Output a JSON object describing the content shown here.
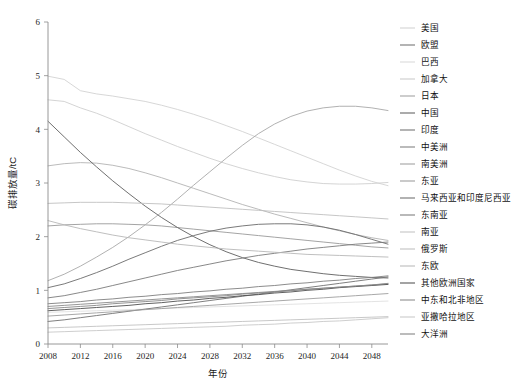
{
  "chart_data": {
    "type": "line",
    "title": "",
    "xlabel": "年份",
    "ylabel": "碳排放量/tC",
    "xlim": [
      2008,
      2050
    ],
    "ylim": [
      0,
      6
    ],
    "grid": false,
    "legend_position": "right",
    "xticks": [
      2008,
      2012,
      2016,
      2020,
      2024,
      2028,
      2032,
      2036,
      2040,
      2044,
      2048
    ],
    "xtick_labels": [
      "2008",
      "2012",
      "2016",
      "2020",
      "2024",
      "2028",
      "2032",
      "2036",
      "2040",
      "2044",
      "2048"
    ],
    "yticks": [
      0,
      1,
      2,
      3,
      4,
      5,
      6
    ],
    "ytick_labels": [
      "0",
      "1",
      "2",
      "3",
      "4",
      "5",
      "6"
    ],
    "x": [
      2008,
      2010,
      2012,
      2014,
      2016,
      2018,
      2020,
      2022,
      2024,
      2026,
      2028,
      2030,
      2032,
      2034,
      2036,
      2038,
      2040,
      2042,
      2044,
      2046,
      2048,
      2050
    ],
    "series": [
      {
        "name": "美国",
        "color": "#d2d2d2",
        "values": [
          4.99,
          4.93,
          4.72,
          4.66,
          4.62,
          4.57,
          4.52,
          4.45,
          4.37,
          4.28,
          4.18,
          4.07,
          3.96,
          3.84,
          3.72,
          3.6,
          3.48,
          3.36,
          3.24,
          3.13,
          3.03,
          2.95
        ]
      },
      {
        "name": "欧盟",
        "color": "#9a9a9a",
        "values": [
          2.2,
          2.22,
          2.23,
          2.24,
          2.24,
          2.23,
          2.22,
          2.2,
          2.17,
          2.14,
          2.11,
          2.08,
          2.05,
          2.02,
          1.99,
          1.96,
          1.93,
          1.9,
          1.87,
          1.84,
          1.81,
          1.79
        ]
      },
      {
        "name": "巴西",
        "color": "#e0e0e0",
        "values": [
          0.59,
          0.6,
          0.61,
          0.62,
          0.63,
          0.64,
          0.65,
          0.66,
          0.67,
          0.68,
          0.69,
          0.7,
          0.71,
          0.72,
          0.73,
          0.74,
          0.75,
          0.76,
          0.77,
          0.78,
          0.79,
          0.8
        ]
      },
      {
        "name": "加拿大",
        "color": "#cfcfcf",
        "values": [
          4.55,
          4.52,
          4.4,
          4.3,
          4.18,
          4.05,
          3.92,
          3.8,
          3.68,
          3.57,
          3.46,
          3.36,
          3.27,
          3.19,
          3.12,
          3.06,
          3.02,
          2.99,
          2.98,
          2.98,
          2.99,
          3.01
        ]
      },
      {
        "name": "日本",
        "color": "#b3b3b3",
        "values": [
          3.32,
          3.36,
          3.38,
          3.37,
          3.33,
          3.27,
          3.19,
          3.1,
          3.0,
          2.9,
          2.8,
          2.7,
          2.6,
          2.51,
          2.42,
          2.34,
          2.26,
          2.18,
          2.11,
          2.04,
          1.98,
          1.93
        ]
      },
      {
        "name": "中国",
        "color": "#5f5f5f",
        "values": [
          4.15,
          3.86,
          3.57,
          3.3,
          3.04,
          2.8,
          2.57,
          2.36,
          2.17,
          2.0,
          1.85,
          1.72,
          1.61,
          1.52,
          1.45,
          1.39,
          1.35,
          1.31,
          1.28,
          1.26,
          1.24,
          1.23
        ]
      },
      {
        "name": "印度",
        "color": "#707070",
        "values": [
          0.42,
          0.45,
          0.49,
          0.53,
          0.57,
          0.61,
          0.65,
          0.69,
          0.73,
          0.77,
          0.81,
          0.85,
          0.89,
          0.93,
          0.97,
          1.01,
          1.05,
          1.09,
          1.13,
          1.17,
          1.21,
          1.25
        ]
      },
      {
        "name": "中美洲",
        "color": "#8a8a8a",
        "values": [
          0.7,
          0.72,
          0.74,
          0.76,
          0.78,
          0.8,
          0.82,
          0.84,
          0.86,
          0.88,
          0.9,
          0.92,
          0.94,
          0.96,
          0.98,
          1.0,
          1.02,
          1.04,
          1.06,
          1.08,
          1.1,
          1.12
        ]
      },
      {
        "name": "南美洲",
        "color": "#9e9e9e",
        "values": [
          0.52,
          0.54,
          0.56,
          0.58,
          0.6,
          0.62,
          0.64,
          0.66,
          0.68,
          0.7,
          0.72,
          0.74,
          0.76,
          0.78,
          0.8,
          0.82,
          0.84,
          0.86,
          0.88,
          0.9,
          0.92,
          0.94
        ]
      },
      {
        "name": "东亚",
        "color": "#a8a8a8",
        "values": [
          1.18,
          1.3,
          1.45,
          1.62,
          1.8,
          2.0,
          2.22,
          2.45,
          2.7,
          2.96,
          3.21,
          3.46,
          3.7,
          3.92,
          4.1,
          4.24,
          4.34,
          4.4,
          4.43,
          4.43,
          4.4,
          4.35
        ]
      },
      {
        "name": "马来西亚和印度尼西亚",
        "color": "#6b6b6b",
        "values": [
          1.05,
          1.12,
          1.22,
          1.33,
          1.45,
          1.58,
          1.7,
          1.82,
          1.93,
          2.02,
          2.1,
          2.16,
          2.2,
          2.23,
          2.24,
          2.24,
          2.22,
          2.18,
          2.12,
          2.04,
          1.95,
          1.86
        ]
      },
      {
        "name": "东南亚",
        "color": "#7a7a7a",
        "values": [
          0.86,
          0.9,
          0.96,
          1.02,
          1.09,
          1.16,
          1.23,
          1.3,
          1.37,
          1.43,
          1.49,
          1.55,
          1.6,
          1.65,
          1.69,
          1.73,
          1.77,
          1.8,
          1.83,
          1.86,
          1.88,
          1.9
        ]
      },
      {
        "name": "南亚",
        "color": "#c2c2c2",
        "values": [
          0.3,
          0.31,
          0.32,
          0.33,
          0.34,
          0.35,
          0.36,
          0.37,
          0.38,
          0.39,
          0.4,
          0.41,
          0.42,
          0.43,
          0.44,
          0.45,
          0.46,
          0.47,
          0.48,
          0.49,
          0.5,
          0.51
        ]
      },
      {
        "name": "俄罗斯",
        "color": "#bfbfbf",
        "values": [
          2.62,
          2.63,
          2.64,
          2.64,
          2.64,
          2.63,
          2.62,
          2.61,
          2.59,
          2.57,
          2.55,
          2.53,
          2.51,
          2.49,
          2.47,
          2.45,
          2.43,
          2.41,
          2.39,
          2.37,
          2.35,
          2.33
        ]
      },
      {
        "name": "东欧",
        "color": "#b8b8b8",
        "values": [
          2.3,
          2.22,
          2.15,
          2.09,
          2.03,
          1.98,
          1.94,
          1.9,
          1.86,
          1.83,
          1.8,
          1.77,
          1.75,
          1.73,
          1.71,
          1.69,
          1.67,
          1.66,
          1.65,
          1.64,
          1.63,
          1.62
        ]
      },
      {
        "name": "其他欧洲国家",
        "color": "#4f4f4f",
        "values": [
          0.62,
          0.64,
          0.66,
          0.68,
          0.7,
          0.72,
          0.75,
          0.77,
          0.8,
          0.82,
          0.85,
          0.87,
          0.9,
          0.92,
          0.95,
          0.97,
          1.0,
          1.02,
          1.05,
          1.07,
          1.09,
          1.11
        ]
      },
      {
        "name": "中东和北非地区",
        "color": "#888888",
        "values": [
          0.66,
          0.68,
          0.7,
          0.72,
          0.75,
          0.77,
          0.79,
          0.81,
          0.84,
          0.86,
          0.88,
          0.9,
          0.93,
          0.95,
          0.97,
          0.99,
          1.02,
          1.04,
          1.06,
          1.08,
          1.1,
          1.13
        ]
      },
      {
        "name": "亚撒哈拉地区",
        "color": "#c8c8c8",
        "values": [
          0.22,
          0.23,
          0.24,
          0.25,
          0.26,
          0.27,
          0.28,
          0.29,
          0.3,
          0.31,
          0.32,
          0.33,
          0.35,
          0.36,
          0.37,
          0.39,
          0.4,
          0.42,
          0.43,
          0.45,
          0.47,
          0.49
        ]
      },
      {
        "name": "大洋洲",
        "color": "#7f7f7f",
        "values": [
          0.75,
          0.77,
          0.79,
          0.82,
          0.84,
          0.87,
          0.89,
          0.92,
          0.94,
          0.97,
          0.99,
          1.02,
          1.04,
          1.07,
          1.09,
          1.12,
          1.14,
          1.17,
          1.19,
          1.22,
          1.24,
          1.27
        ]
      }
    ]
  },
  "legend": {
    "items": [
      {
        "label": "美国",
        "color": "#d2d2d2"
      },
      {
        "label": "欧盟",
        "color": "#6f6f6f"
      },
      {
        "label": "巴西",
        "color": "#d8d8d8"
      },
      {
        "label": "加拿大",
        "color": "#c9c9c9"
      },
      {
        "label": "日本",
        "color": "#9f9f9f"
      },
      {
        "label": "中国",
        "color": "#5f5f5f"
      },
      {
        "label": "印度",
        "color": "#707070"
      },
      {
        "label": "中美洲",
        "color": "#7d7d7d"
      },
      {
        "label": "南美洲",
        "color": "#9e9e9e"
      },
      {
        "label": "东亚",
        "color": "#9a9a9a"
      },
      {
        "label": "马来西亚和印度尼西亚",
        "color": "#6b6b6b"
      },
      {
        "label": "东南亚",
        "color": "#7a7a7a"
      },
      {
        "label": "南亚",
        "color": "#c2c2c2"
      },
      {
        "label": "俄罗斯",
        "color": "#bfbfbf"
      },
      {
        "label": "东欧",
        "color": "#b8b8b8"
      },
      {
        "label": "其他欧洲国家",
        "color": "#4f4f4f"
      },
      {
        "label": "中东和北非地区",
        "color": "#888888"
      },
      {
        "label": "亚撒哈拉地区",
        "color": "#c8c8c8"
      },
      {
        "label": "大洋洲",
        "color": "#7f7f7f"
      }
    ]
  }
}
